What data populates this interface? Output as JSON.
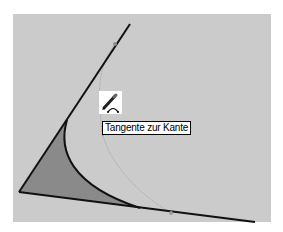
{
  "viewport": {
    "background_color": "#cbcbcb",
    "face_fill_color": "#8a8a8a",
    "edge_color": "#111111",
    "inference_color": "#9a9a9a",
    "marker_color": "#8c8c8c"
  },
  "geometry": {
    "corner_vertex": [
      19,
      192
    ],
    "upper_edge_end": [
      130,
      24
    ],
    "lower_edge_end": [
      255,
      222
    ],
    "upper_midpoint_marker": [
      115,
      44
    ],
    "lower_midpoint_marker": [
      171,
      213
    ],
    "arc_start": [
      67,
      120
    ],
    "arc_end": [
      140,
      208
    ]
  },
  "cursor": {
    "icon": "pencil-arc-icon",
    "tooltip": "Tangente zur Kante"
  }
}
